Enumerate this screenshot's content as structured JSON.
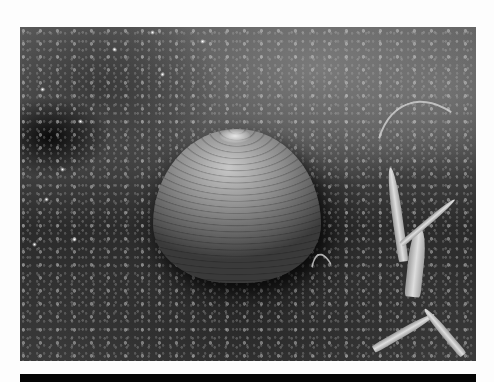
{
  "image": {
    "description": "Grayscale photograph of a clam shell resting on wet sandy ground with blades of grass on the right",
    "subject": "clam shell",
    "background": "wet sand / mud with sparkling droplets",
    "foreground_detail": "grass blades",
    "palette": {
      "border": "#fdfdfd",
      "bottom_bar": "#050505"
    }
  }
}
